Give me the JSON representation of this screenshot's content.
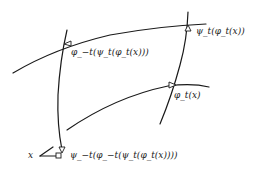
{
  "diagram": {
    "labels": {
      "x": "x",
      "phi_t_x": "φ_t(x)",
      "psi_t_phi_t_x": "ψ_t(φ_t(x))",
      "phi_minus_t_psi": "φ_−t(ψ_t(φ_t(x)))",
      "psi_minus_t_phi_minus_t": "ψ_−t(φ_−t(ψ_t(φ_t(x))))"
    },
    "colors": {
      "stroke": "#1a1a1a",
      "background": "#ffffff"
    }
  }
}
